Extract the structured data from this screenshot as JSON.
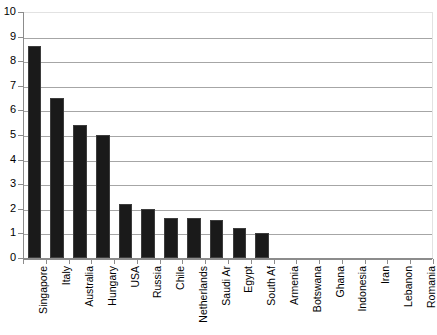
{
  "chart_data": {
    "type": "bar",
    "title": "",
    "subtitle": "",
    "xlabel": "",
    "ylabel": "",
    "ylim": [
      0,
      10
    ],
    "y_ticks": [
      0,
      1,
      2,
      3,
      4,
      5,
      6,
      7,
      8,
      9,
      10
    ],
    "grid": true,
    "legend": false,
    "bar_color": "#1a1a1a",
    "gridline_color": "#a6a6a6",
    "axis_color": "#8c8c8c",
    "categories": [
      "Singapore",
      "Italy",
      "Australia",
      "Hungary",
      "USA",
      "Russia",
      "Chile",
      "Netherlands",
      "Saudi Ar",
      "Egypt",
      "South Af",
      "Armenia",
      "Botswana",
      "Ghana",
      "Indonesia",
      "Iran",
      "Lebanon",
      "Romania"
    ],
    "values": [
      8.6,
      6.5,
      5.4,
      5.0,
      2.2,
      2.0,
      1.62,
      1.62,
      1.55,
      1.22,
      1.0,
      0,
      0,
      0,
      0,
      0,
      0,
      0
    ]
  }
}
